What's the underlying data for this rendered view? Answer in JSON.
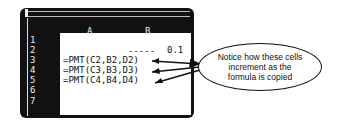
{
  "spreadsheet": {
    "columns": [
      "A",
      "B"
    ],
    "rows": [
      "1",
      "2",
      "3",
      "4",
      "5",
      "6",
      "7"
    ],
    "cells": {
      "b2_value": "0.1",
      "b2_leader": "-----",
      "a3": "=PMT(C2,B2,D2)",
      "a4": "=PMT(C3,B3,D3)",
      "a5": "=PMT(C4,B4,D4)"
    }
  },
  "callout": {
    "text_line1": "Notice how these cells",
    "text_line2": "increment as the",
    "text_line3": "formula is copied"
  }
}
